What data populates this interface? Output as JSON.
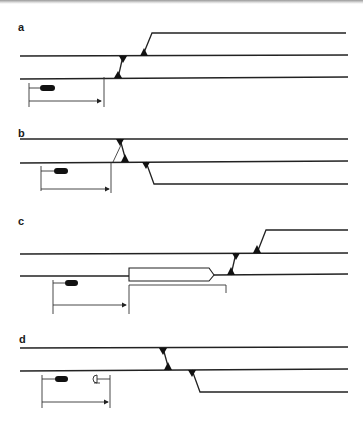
{
  "figure": {
    "colors": {
      "line": "#222222",
      "fill": "#111111",
      "background": "#ffffff"
    }
  },
  "panels": [
    {
      "label": "a",
      "elements": [
        "two parallel tracks",
        "crossover",
        "turnout diverging upward",
        "train",
        "distance arrow ending before crossover"
      ]
    },
    {
      "label": "b",
      "elements": [
        "two parallel tracks",
        "crossover",
        "turnout diverging downward",
        "train",
        "distance arrow ending at crossover"
      ]
    },
    {
      "label": "c",
      "elements": [
        "two parallel tracks",
        "standing train on track",
        "overlap bracket",
        "crossover",
        "turnout diverging upward",
        "train",
        "distance arrow ending at standing train"
      ]
    },
    {
      "label": "d",
      "elements": [
        "two parallel tracks",
        "crossover",
        "turnout diverging downward",
        "train",
        "buffer stop / signal symbol",
        "distance arrow"
      ]
    }
  ]
}
